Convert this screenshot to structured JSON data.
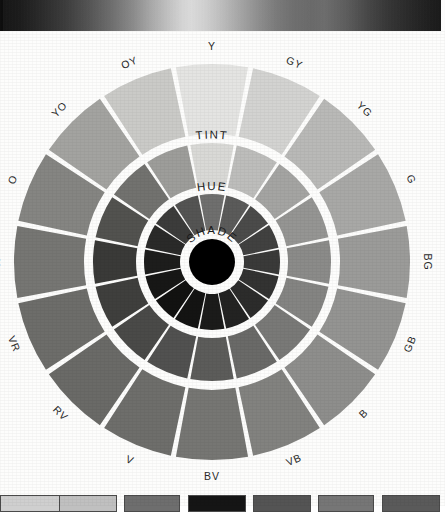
{
  "figure": {
    "type": "color-wheel-diagram",
    "background_color": "#fdfdfc"
  },
  "top_band": {
    "name": "grayscale-value-gradient-strip",
    "stops": [
      "#151515",
      "#3d3d3d",
      "#6e6e6e",
      "#aaaaaa",
      "#dcdcdc",
      "#a6a6a6",
      "#6f6f6f",
      "#333333",
      "#181818"
    ]
  },
  "wheel": {
    "center": {
      "x": 212,
      "y": 230
    },
    "separator_color": "#ffffff",
    "core": {
      "label": "center-black-disc",
      "color": "#000000",
      "radius": 23
    },
    "ring_labels": [
      {
        "text": "TINT",
        "ring": "outer"
      },
      {
        "text": "HUE",
        "ring": "middle"
      },
      {
        "text": "SHADE",
        "ring": "inner"
      }
    ],
    "rings": [
      {
        "name": "tint",
        "label": "TINT",
        "r_inner": 128,
        "r_outer": 198
      },
      {
        "name": "hue",
        "label": "HUE",
        "r_inner": 76,
        "r_outer": 119
      },
      {
        "name": "shade",
        "label": "SHADE",
        "r_inner": 32,
        "r_outer": 68
      }
    ],
    "sectors": [
      {
        "code": "Y",
        "angle": 0,
        "tint": "#e4e4e2",
        "hue": "#d9d9d6",
        "shade": "#6f6f6e"
      },
      {
        "code": "GY",
        "angle": 22.5,
        "tint": "#d3d3d1",
        "hue": "#bdbdbb",
        "shade": "#5b5b5a"
      },
      {
        "code": "YG",
        "angle": 45,
        "tint": "#b9b9b7",
        "hue": "#a4a4a2",
        "shade": "#4b4b4a"
      },
      {
        "code": "G",
        "angle": 67.5,
        "tint": "#a8a8a6",
        "hue": "#959593",
        "shade": "#414140"
      },
      {
        "code": "BG",
        "angle": 90,
        "tint": "#9b9b99",
        "hue": "#8b8b89",
        "shade": "#3a3a39"
      },
      {
        "code": "GB",
        "angle": 112.5,
        "tint": "#949492",
        "hue": "#848482",
        "shade": "#333332"
      },
      {
        "code": "B",
        "angle": 135,
        "tint": "#8e8e8c",
        "hue": "#797977",
        "shade": "#2c2c2b"
      },
      {
        "code": "VB",
        "angle": 157.5,
        "tint": "#82827f",
        "hue": "#6a6a68",
        "shade": "#232322"
      },
      {
        "code": "BV",
        "angle": 180,
        "tint": "#767673",
        "hue": "#5c5c5a",
        "shade": "#1b1b1a"
      },
      {
        "code": "V",
        "angle": 202.5,
        "tint": "#6e6e6b",
        "hue": "#515150",
        "shade": "#141413"
      },
      {
        "code": "RV",
        "angle": 225,
        "tint": "#6a6a67",
        "hue": "#4a4a48",
        "shade": "#121211"
      },
      {
        "code": "VR",
        "angle": 247.5,
        "tint": "#6d6d6a",
        "hue": "#3f3f3d",
        "shade": "#171716"
      },
      {
        "code": "R",
        "angle": 270,
        "tint": "#767673",
        "hue": "#3a3a38",
        "shade": "#1d1d1c"
      },
      {
        "code": "O",
        "angle": 292.5,
        "tint": "#858582",
        "hue": "#52524f",
        "shade": "#2a2a29"
      },
      {
        "code": "YO",
        "angle": 315,
        "tint": "#a3a3a0",
        "hue": "#72726f",
        "shade": "#3c3c3b"
      },
      {
        "code": "OY",
        "angle": 337.5,
        "tint": "#cacac7",
        "hue": "#9d9d9a",
        "shade": "#545453"
      }
    ]
  },
  "bottom_swatches": [
    {
      "color": "#cfcfcf",
      "x": 0,
      "width": 62
    },
    {
      "color": "#c0c0c0",
      "x": 59,
      "width": 58
    },
    {
      "color": "#6e6e6e",
      "x": 124,
      "width": 56
    },
    {
      "color": "#151515",
      "x": 188,
      "width": 58
    },
    {
      "color": "#545454",
      "x": 253,
      "width": 58
    },
    {
      "color": "#767676",
      "x": 318,
      "width": 56
    },
    {
      "color": "#5a5a5a",
      "x": 382,
      "width": 58
    }
  ]
}
